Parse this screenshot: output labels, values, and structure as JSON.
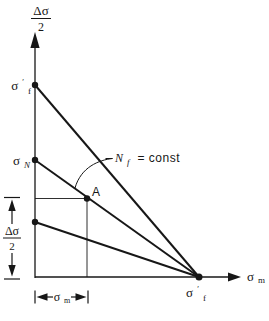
{
  "diagram": {
    "colors": {
      "ink": "#171717",
      "background": "#ffffff"
    },
    "y_axis_label": {
      "numerator": "Δσ",
      "denominator": "2"
    },
    "x_axis_label": {
      "base": "σ",
      "sub": "m"
    },
    "points": {
      "y_intercept_top": {
        "base": "σ",
        "prime": "′",
        "sub": "f"
      },
      "y_intercept_mid": {
        "base": "σ",
        "sub": "N"
      },
      "point_a": {
        "label": "A"
      },
      "x_intercept": {
        "base": "σ",
        "prime": "′",
        "sub": "f"
      }
    },
    "annotations": {
      "life_lines": {
        "var": "N",
        "sub": "f",
        "eq": "= const"
      },
      "left_dimension": {
        "numerator": "Δσ",
        "denominator": "2"
      },
      "bottom_dimension": {
        "base": "σ",
        "sub": "m"
      }
    }
  }
}
